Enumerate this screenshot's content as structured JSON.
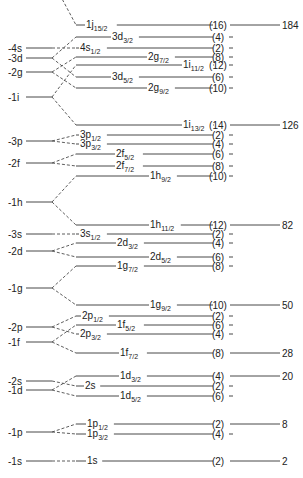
{
  "unsplit_levels": [
    {
      "id": "4s",
      "label": "-4s",
      "y": 48
    },
    {
      "id": "3d",
      "label": "-3d",
      "y": 58
    },
    {
      "id": "2g",
      "label": "-2g",
      "y": 72
    },
    {
      "id": "1i",
      "label": "-1i",
      "y": 97
    },
    {
      "id": "3p",
      "label": "-3p",
      "y": 141
    },
    {
      "id": "2f",
      "label": "-2f",
      "y": 163
    },
    {
      "id": "1h",
      "label": "-1h",
      "y": 202
    },
    {
      "id": "3s",
      "label": "-3s",
      "y": 234
    },
    {
      "id": "2d",
      "label": "-2d",
      "y": 251
    },
    {
      "id": "1g",
      "label": "-1g",
      "y": 288
    },
    {
      "id": "2p",
      "label": "-2p",
      "y": 327
    },
    {
      "id": "1f",
      "label": "-1f",
      "y": 342
    },
    {
      "id": "2s",
      "label": "-2s",
      "y": 381
    },
    {
      "id": "1d",
      "label": "-1d",
      "y": 390
    },
    {
      "id": "1p",
      "label": "-1p",
      "y": 432
    },
    {
      "id": "1s",
      "label": "-1s",
      "y": 461
    }
  ],
  "split_levels": [
    {
      "n": "1j",
      "sub": "15/2",
      "parent": "1i_up",
      "y": 25,
      "occ": "(16)",
      "magic": "184",
      "lx": 86
    },
    {
      "n": "3d",
      "sub": "3/2",
      "parent": "3d",
      "y": 37,
      "occ": "(4)",
      "lx": 112
    },
    {
      "n": "4s",
      "sub": "1/2",
      "parent": "4s",
      "y": 48,
      "occ": "(2)",
      "lx": 80
    },
    {
      "n": "2g",
      "sub": "7/2",
      "parent": "2g",
      "y": 57,
      "occ": "(8)",
      "lx": 148
    },
    {
      "n": "1i",
      "sub": "11/2",
      "parent": "1i",
      "y": 65,
      "occ": "(12)",
      "lx": 183
    },
    {
      "n": "3d",
      "sub": "5/2",
      "parent": "3d",
      "y": 77,
      "occ": "(6)",
      "lx": 112
    },
    {
      "n": "2g",
      "sub": "9/2",
      "parent": "2g",
      "y": 88,
      "occ": "(10)",
      "lx": 148
    },
    {
      "n": "1i",
      "sub": "13/2",
      "parent": "1i",
      "y": 125,
      "occ": "(14)",
      "magic": "126",
      "lx": 183
    },
    {
      "n": "3p",
      "sub": "1/2",
      "parent": "3p",
      "y": 135,
      "occ": "(2)",
      "lx": 80
    },
    {
      "n": "3p",
      "sub": "3/2",
      "parent": "3p",
      "y": 144,
      "occ": "(4)",
      "lx": 80
    },
    {
      "n": "2f",
      "sub": "5/2",
      "parent": "2f",
      "y": 154,
      "occ": "(6)",
      "lx": 116
    },
    {
      "n": "2f",
      "sub": "7/2",
      "parent": "2f",
      "y": 166,
      "occ": "(8)",
      "lx": 116
    },
    {
      "n": "1h",
      "sub": "9/2",
      "parent": "1h",
      "y": 176,
      "occ": "(10)",
      "lx": 150
    },
    {
      "n": "1h",
      "sub": "11/2",
      "parent": "1h",
      "y": 225,
      "occ": "(12)",
      "magic": "82",
      "lx": 150
    },
    {
      "n": "3s",
      "sub": "1/2",
      "parent": "3s",
      "y": 234,
      "occ": "(2)",
      "lx": 80
    },
    {
      "n": "2d",
      "sub": "3/2",
      "parent": "2d",
      "y": 243,
      "occ": "(4)",
      "lx": 117
    },
    {
      "n": "2d",
      "sub": "5/2",
      "parent": "2d",
      "y": 257,
      "occ": "(6)",
      "lx": 150
    },
    {
      "n": "1g",
      "sub": "7/2",
      "parent": "1g",
      "y": 266,
      "occ": "(8)",
      "lx": 117
    },
    {
      "n": "1g",
      "sub": "9/2",
      "parent": "1g",
      "y": 305,
      "occ": "(10)",
      "magic": "50",
      "lx": 150
    },
    {
      "n": "2p",
      "sub": "1/2",
      "parent": "2p",
      "y": 316,
      "occ": "(2)",
      "lx": 82
    },
    {
      "n": "1f",
      "sub": "5/2",
      "parent": "1f",
      "y": 325,
      "occ": "(6)",
      "lx": 117
    },
    {
      "n": "2p",
      "sub": "3/2",
      "parent": "2p",
      "y": 334,
      "occ": "(4)",
      "lx": 80
    },
    {
      "n": "1f",
      "sub": "7/2",
      "parent": "1f",
      "y": 353,
      "occ": "(8)",
      "magic": "28",
      "lx": 120
    },
    {
      "n": "1d",
      "sub": "3/2",
      "parent": "1d",
      "y": 376,
      "occ": "(4)",
      "magic": "20",
      "lx": 120
    },
    {
      "n": "2s",
      "sub": "",
      "parent": "2s",
      "y": 386,
      "occ": "(2)",
      "lx": 85
    },
    {
      "n": "1d",
      "sub": "5/2",
      "parent": "1d",
      "y": 396,
      "occ": "(6)",
      "lx": 120
    },
    {
      "n": "1p",
      "sub": "1/2",
      "parent": "1p",
      "y": 424,
      "occ": "(2)",
      "magic": "8",
      "lx": 87
    },
    {
      "n": "1p",
      "sub": "3/2",
      "parent": "1p",
      "y": 434,
      "occ": "(4)",
      "lx": 87
    },
    {
      "n": "1s",
      "sub": "",
      "parent": "1s",
      "y": 461,
      "occ": "(2)",
      "magic": "2",
      "lx": 87
    }
  ],
  "magic_numbers": [
    "2",
    "8",
    "20",
    "28",
    "50",
    "82",
    "126",
    "184"
  ]
}
